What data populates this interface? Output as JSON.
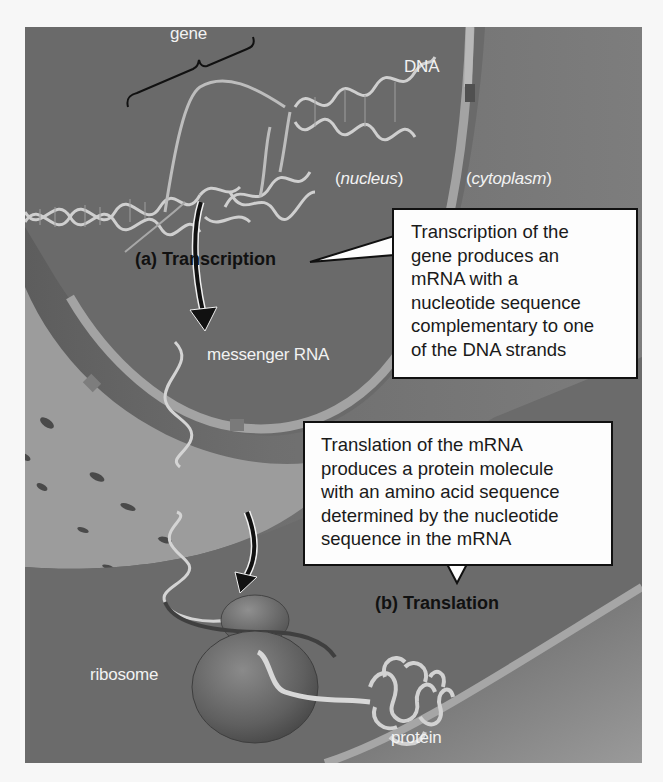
{
  "figure": {
    "labels": {
      "gene": "gene",
      "dna": "DNA",
      "nucleus": "nucleus",
      "cytoplasm": "cytoplasm",
      "messenger_rna": "messenger RNA",
      "ribosome": "ribosome",
      "protein": "protein"
    },
    "steps": [
      {
        "id": "a",
        "label": "(a) Transcription",
        "callout_lines": [
          "Transcription of the",
          "gene produces an",
          "mRNA with a",
          "nucleotide sequence",
          "complementary to one",
          "of the DNA strands"
        ]
      },
      {
        "id": "b",
        "label": "(b) Translation",
        "callout_lines": [
          "Translation of the mRNA",
          "produces a protein molecule",
          "with an amino acid sequence",
          "determined by the nucleotide",
          "sequence in the mRNA"
        ]
      }
    ],
    "colors": {
      "nucleus_bg": "#6a6a6a",
      "cytoplasm_bg": "#747474",
      "envelope": "#a8a8a8",
      "callout_bg": "#fdfdfd",
      "callout_border": "#111111",
      "label_light": "#f2f2f2",
      "label_dark": "#111111"
    }
  }
}
